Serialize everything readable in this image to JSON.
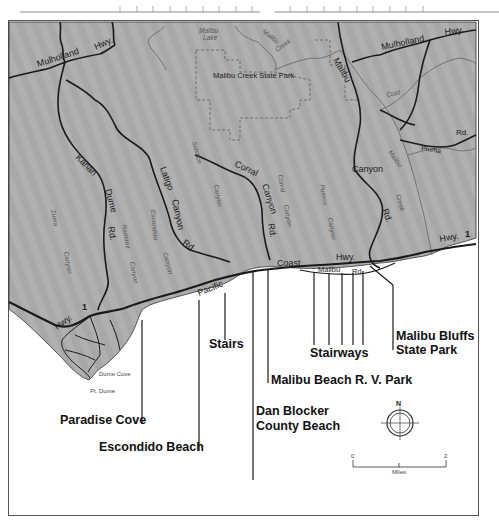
{
  "map": {
    "park_label": "Malibu Creek State Park",
    "lake_label": "Malibu Lake",
    "creek_labels": [
      "Malibu",
      "Creek"
    ],
    "cold_creek_label": "Cold",
    "road_labels": {
      "mulholland_west": "Mulholland",
      "hwy_west": "Hwy.",
      "mulholland_east": "Mulholland",
      "hwy_east": "Hwy.",
      "malibu_canyon_1": "Malibu",
      "malibu_canyon_2": "Canyon",
      "malibu_canyon_3": "Rd.",
      "kanan_1": "Kanan",
      "kanan_2": "Dume",
      "kanan_3": "Rd.",
      "latigo_1": "Latigo",
      "latigo_2": "Canyon",
      "latigo_3": "Rd.",
      "corral_1": "Corral",
      "corral_2": "Canyon",
      "corral_3": "Rd.",
      "piuma_1": "Piuma",
      "piuma_2": "Rd.",
      "pch_pacific": "Pacific",
      "pch_coast": "Coast",
      "pch_hwy": "Hwy.",
      "pch_hwy_east": "Hwy.",
      "pch_num_east": "1",
      "pch_hwy_west": "Hwy.",
      "pch_num_west": "1",
      "malibu_rd_1": "Malibu",
      "malibu_rd_2": "Rd"
    },
    "canyon_labels": {
      "zuma_1": "Zuma",
      "zuma_2": "Canyon",
      "ramirez_1": "Ramirez",
      "ramirez_2": "Canyon",
      "escondido_1": "Escondido",
      "escondido_2": "Canyon",
      "solstice_1": "Solstice",
      "solstice_2": "Canyon",
      "corral_1": "Corral",
      "corral_2": "Canyon",
      "puerco_1": "Puerco",
      "puerco_2": "Canyon",
      "malibu_creek_1": "Malibu",
      "malibu_creek_2": "Creek"
    },
    "point_labels": {
      "dume_cove": "Dume Cove",
      "pt_dume": "Pt. Dume"
    },
    "callouts": [
      {
        "id": "paradise-cove",
        "label": "Paradise Cove"
      },
      {
        "id": "escondido-beach",
        "label": "Escondido Beach"
      },
      {
        "id": "stairs",
        "label": "Stairs"
      },
      {
        "id": "dan-blocker-1",
        "label": "Dan Blocker"
      },
      {
        "id": "dan-blocker-2",
        "label": "County Beach"
      },
      {
        "id": "malibu-beach-rv",
        "label": "Malibu Beach R. V. Park"
      },
      {
        "id": "stairways",
        "label": "Stairways"
      },
      {
        "id": "malibu-bluffs-1",
        "label": "Malibu Bluffs"
      },
      {
        "id": "malibu-bluffs-2",
        "label": "State Park"
      }
    ],
    "compass": {
      "north_label": "N"
    },
    "scale": {
      "start": "0",
      "end": "2",
      "unit": "Miles"
    },
    "colors": {
      "land": "#a9a9a9",
      "ocean": "#ffffff",
      "road_major": "#1a1a1a",
      "creek": "#6b6b6b",
      "park_boundary": "#666666"
    }
  }
}
